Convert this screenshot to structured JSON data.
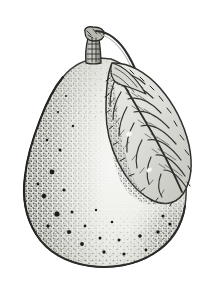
{
  "image": {
    "subject": "pear",
    "style": "vintage botanical line engraving with stipple shading",
    "canvas": {
      "width": 209,
      "height": 283
    },
    "background_color": "#ffffff"
  },
  "palette": {
    "background": "#ffffff",
    "paper_tint": "#fdfdfc",
    "flesh_light": "#f3f3f0",
    "flesh_mid": "#e8e8e4",
    "flesh_shadow": "#d6d6d0",
    "outline": "#3a3a38",
    "outline_soft": "#6e6e6a",
    "stipple": "#2b2b29",
    "speck_dark": "#1b1b1a",
    "leaf_fill": "#e2e2dc",
    "leaf_shadow": "#bdbdb6",
    "leaf_vein": "#333331",
    "stem_fill": "#cfcfc8",
    "stem_dark": "#2e2e2c"
  },
  "parts": {
    "fruit": {
      "label": "Pear body",
      "outline_path": "M100,58 C84,59 72,66 63,77 C53,89 46,104 40,120 C33,138 27,157 25,176 C22,198 26,218 36,234 C47,252 67,263 90,266 C112,269 135,265 153,254 C171,243 182,226 185,206 C188,186 185,165 178,146 C171,126 161,107 149,91 C138,76 125,64 111,59 Z",
      "bounds": {
        "left": 23,
        "top": 55,
        "right": 187,
        "bottom": 268
      },
      "widest_y": 205,
      "neck_y": 62
    },
    "stem": {
      "label": "Fruit stem",
      "description": "short gnarled woody stem at apex",
      "bounds": {
        "left": 82,
        "top": 27,
        "right": 104,
        "bottom": 64
      },
      "knob_center": {
        "x": 92,
        "y": 34
      }
    },
    "leaf": {
      "label": "Leaf",
      "description": "single lanceolate leaf with serrated edge and dense hatched venation, curving from stem down along the right shoulder of the fruit",
      "outline_path": "M112,63 C128,62 146,72 160,88 C174,104 184,124 189,145 C193,164 191,182 183,194 C175,205 162,206 150,199 C137,192 126,178 118,162 C110,146 106,128 106,110 C106,92 107,74 112,63 Z",
      "bounds": {
        "left": 104,
        "top": 60,
        "right": 195,
        "bottom": 205
      },
      "petiole": {
        "label": "Leaf stalk",
        "from": {
          "x": 95,
          "y": 32
        },
        "to": {
          "x": 130,
          "y": 78
        }
      },
      "vein_count": 11,
      "midrib": {
        "from": {
          "x": 116,
          "y": 70
        },
        "to": {
          "x": 182,
          "y": 193
        }
      }
    },
    "shading": {
      "label": "Stipple shading",
      "description": "dense stippled dots concentrated along the left margin and the lower-right margin, fading toward the lit centre",
      "dense_regions": [
        "left-edge",
        "lower-right-edge",
        "bottom-edge"
      ],
      "lit_region": "center",
      "speck_count_large": 28,
      "texture": "faint horizontal engraving lines across the fruit body"
    }
  },
  "specks": [
    {
      "x": 52,
      "y": 172,
      "r": 2.4
    },
    {
      "x": 44,
      "y": 196,
      "r": 2.2
    },
    {
      "x": 64,
      "y": 190,
      "r": 1.6
    },
    {
      "x": 57,
      "y": 214,
      "r": 2.6
    },
    {
      "x": 72,
      "y": 212,
      "r": 1.5
    },
    {
      "x": 48,
      "y": 226,
      "r": 1.7
    },
    {
      "x": 69,
      "y": 232,
      "r": 2.0
    },
    {
      "x": 85,
      "y": 226,
      "r": 1.4
    },
    {
      "x": 82,
      "y": 244,
      "r": 1.9
    },
    {
      "x": 100,
      "y": 238,
      "r": 1.5
    },
    {
      "x": 104,
      "y": 252,
      "r": 1.7
    },
    {
      "x": 119,
      "y": 240,
      "r": 1.5
    },
    {
      "x": 124,
      "y": 254,
      "r": 1.6
    },
    {
      "x": 140,
      "y": 236,
      "r": 1.8
    },
    {
      "x": 146,
      "y": 250,
      "r": 1.4
    },
    {
      "x": 158,
      "y": 232,
      "r": 1.7
    },
    {
      "x": 163,
      "y": 216,
      "r": 1.5
    },
    {
      "x": 170,
      "y": 224,
      "r": 1.6
    },
    {
      "x": 60,
      "y": 150,
      "r": 1.5
    },
    {
      "x": 47,
      "y": 140,
      "r": 1.3
    },
    {
      "x": 73,
      "y": 126,
      "r": 1.2
    },
    {
      "x": 58,
      "y": 112,
      "r": 1.1
    },
    {
      "x": 66,
      "y": 96,
      "r": 1.0
    },
    {
      "x": 96,
      "y": 210,
      "r": 1.2
    },
    {
      "x": 112,
      "y": 222,
      "r": 1.3
    },
    {
      "x": 152,
      "y": 200,
      "r": 1.4
    },
    {
      "x": 167,
      "y": 196,
      "r": 1.2
    },
    {
      "x": 38,
      "y": 184,
      "r": 1.4
    }
  ]
}
